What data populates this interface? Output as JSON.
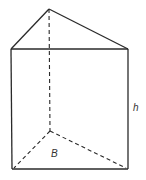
{
  "diagram": {
    "labels": {
      "height": "h",
      "base": "B"
    },
    "colors": {
      "line": "#2a2a2a",
      "background": "#ffffff"
    },
    "vertices": {
      "apex_top": [
        49,
        9
      ],
      "top_left": [
        11,
        49
      ],
      "top_right": [
        128,
        49
      ],
      "bottom_left": [
        12,
        169
      ],
      "bottom_right": [
        128,
        169
      ],
      "back_bottom": [
        50,
        131
      ]
    }
  }
}
